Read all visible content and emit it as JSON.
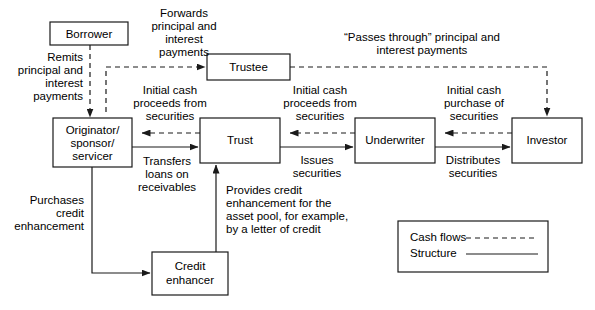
{
  "diagram": {
    "colors": {
      "background": "#ffffff",
      "stroke": "#1a1a1a",
      "text": "#000000"
    },
    "nodes": [
      {
        "id": "borrower",
        "label": "Borrower",
        "lines": [
          "Borrower"
        ]
      },
      {
        "id": "trustee",
        "label": "Trustee",
        "lines": [
          "Trustee"
        ]
      },
      {
        "id": "originator",
        "label": "Originator/ sponsor/ servicer",
        "lines": [
          "Originator/",
          "sponsor/",
          "servicer"
        ]
      },
      {
        "id": "trust",
        "label": "Trust",
        "lines": [
          "Trust"
        ]
      },
      {
        "id": "underwriter",
        "label": "Underwriter",
        "lines": [
          "Underwriter"
        ]
      },
      {
        "id": "investor",
        "label": "Investor",
        "lines": [
          "Investor"
        ]
      },
      {
        "id": "credit_enhancer",
        "label": "Credit enhancer",
        "lines": [
          "Credit",
          "enhancer"
        ]
      }
    ],
    "edge_labels": {
      "forwards_payments": [
        "Forwards",
        "principal and",
        "interest",
        "payments"
      ],
      "remits_payments": [
        "Remits",
        "principal and",
        "interest",
        "payments"
      ],
      "passes_through": [
        "“Passes through” principal and",
        "interest payments"
      ],
      "initial_cash_proceeds_left": [
        "Initial cash",
        "proceeds from",
        "securities"
      ],
      "initial_cash_proceeds_right": [
        "Initial cash",
        "proceeds from",
        "securities"
      ],
      "initial_cash_purchase": [
        "Initial cash",
        "purchase of",
        "securities"
      ],
      "transfers_loans": [
        "Transfers",
        "loans on",
        "receivables"
      ],
      "issues_securities": [
        "Issues",
        "securities"
      ],
      "distributes_securities": [
        "Distributes",
        "securities"
      ],
      "purchases_credit_enhancement": [
        "Purchases",
        "credit",
        "enhancement"
      ],
      "provides_credit_enhancement": [
        "Provides credit",
        "enhancement for the",
        "asset pool, for example,",
        "by a letter of credit"
      ]
    },
    "legend": {
      "items": [
        {
          "id": "cash-flows",
          "label": "Cash flows",
          "style": "dashed"
        },
        {
          "id": "structure",
          "label": "Structure",
          "style": "solid"
        }
      ]
    }
  }
}
